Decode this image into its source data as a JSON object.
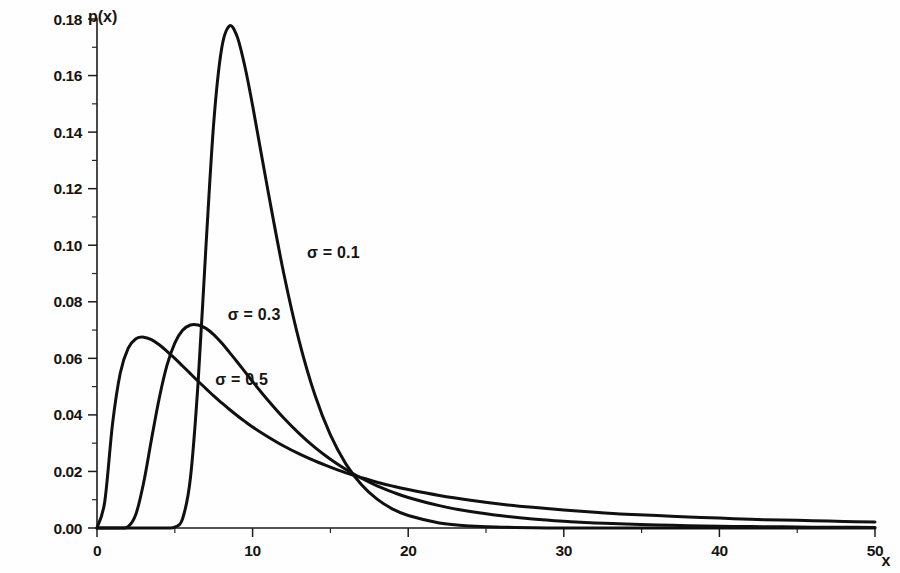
{
  "figure": {
    "name": "lognormal-pdf-family",
    "background_color": "#fefefe",
    "ink_color": "#101010"
  },
  "axes": {
    "y_title": "p(x)",
    "x_title": "x",
    "y_ticks": [
      "0.00",
      "0.02",
      "0.04",
      "0.06",
      "0.08",
      "0.10",
      "0.12",
      "0.14",
      "0.16",
      "0.18"
    ],
    "y_tick_values": [
      0.0,
      0.02,
      0.04,
      0.06,
      0.08,
      0.1,
      0.12,
      0.14,
      0.16,
      0.18
    ],
    "y_minor_tick_values": [
      0.01,
      0.03,
      0.05,
      0.07,
      0.09,
      0.11,
      0.13,
      0.15,
      0.17
    ],
    "x_ticks": [
      "0",
      "10",
      "20",
      "30",
      "40",
      "50"
    ],
    "x_tick_values": [
      0,
      10,
      20,
      30,
      40,
      50
    ],
    "x_minor_tick_values": [
      5,
      15,
      25,
      35,
      45
    ]
  },
  "curve_labels": [
    {
      "text": "σ = 0.1",
      "x_data": 13.5,
      "y_data": 0.0955
    },
    {
      "text": "σ = 0.3",
      "x_data": 8.4,
      "y_data": 0.0735
    },
    {
      "text": "σ = 0.5",
      "x_data": 7.6,
      "y_data": 0.0505
    }
  ],
  "chart_data": {
    "type": "line",
    "title": "",
    "subtitle": "",
    "xlabel": "x",
    "ylabel": "p(x)",
    "xlim": [
      0,
      50
    ],
    "ylim": [
      0.0,
      0.18
    ],
    "grid": false,
    "legend": "inline-annotations",
    "distribution": "lognormal",
    "x": [
      0,
      0.5,
      1,
      1.5,
      2,
      2.5,
      3,
      3.5,
      4,
      4.5,
      5,
      5.5,
      6,
      6.5,
      7,
      7.5,
      8,
      8.5,
      9,
      9.5,
      10,
      11,
      12,
      13,
      14,
      15,
      16,
      17,
      18,
      19,
      20,
      22,
      24,
      26,
      28,
      30,
      32,
      34,
      36,
      38,
      40,
      42,
      44,
      46,
      48,
      50
    ],
    "series": [
      {
        "name": "σ = 0.1",
        "label": "σ = 0.1",
        "sigma": 0.1,
        "median": 10.0,
        "peak_x": 9.4,
        "peak_y": 0.178,
        "values": [
          0.0,
          0.0,
          0.0,
          0.0,
          0.0,
          0.0,
          0.0,
          0.0,
          0.0,
          0.0,
          0.0003,
          0.0033,
          0.0175,
          0.0517,
          0.0993,
          0.1432,
          0.1692,
          0.1775,
          0.1739,
          0.1633,
          0.1494,
          0.1189,
          0.0901,
          0.066,
          0.0471,
          0.0329,
          0.0226,
          0.0153,
          0.0102,
          0.0067,
          0.0044,
          0.0018,
          0.0007,
          0.0003,
          0.0001,
          0.0,
          0.0,
          0.0,
          0.0,
          0.0,
          0.0,
          0.0,
          0.0,
          0.0,
          0.0,
          0.0
        ]
      },
      {
        "name": "σ = 0.3",
        "label": "σ = 0.3",
        "sigma": 0.3,
        "median": 10.0,
        "peak_x": 6.2,
        "peak_y": 0.0732,
        "values": [
          0.0,
          0.0,
          0.0,
          0.0,
          0.0005,
          0.0049,
          0.0161,
          0.0313,
          0.0459,
          0.0576,
          0.0654,
          0.0699,
          0.0718,
          0.0718,
          0.0706,
          0.0684,
          0.0655,
          0.0622,
          0.0588,
          0.0553,
          0.0518,
          0.0451,
          0.0389,
          0.0334,
          0.0285,
          0.0243,
          0.0207,
          0.0176,
          0.0149,
          0.0127,
          0.0108,
          0.0079,
          0.0058,
          0.0043,
          0.0032,
          0.0024,
          0.0018,
          0.0014,
          0.0011,
          0.0008,
          0.0006,
          0.0005,
          0.0004,
          0.0003,
          0.0003,
          0.0002
        ]
      },
      {
        "name": "σ = 0.5",
        "label": "σ = 0.5",
        "sigma": 0.5,
        "median": 10.0,
        "peak_x": 2.7,
        "peak_y": 0.0676,
        "values": [
          0.0,
          0.0094,
          0.0369,
          0.0549,
          0.0635,
          0.0669,
          0.0675,
          0.0666,
          0.0648,
          0.0625,
          0.06,
          0.0573,
          0.0546,
          0.0519,
          0.0493,
          0.0467,
          0.0443,
          0.042,
          0.0398,
          0.0377,
          0.0357,
          0.0322,
          0.029,
          0.0262,
          0.0237,
          0.0215,
          0.0195,
          0.0178,
          0.0162,
          0.0148,
          0.0136,
          0.0115,
          0.0098,
          0.0084,
          0.0073,
          0.0064,
          0.0056,
          0.0049,
          0.0044,
          0.0039,
          0.0035,
          0.0031,
          0.0028,
          0.0026,
          0.0023,
          0.0021
        ]
      }
    ]
  }
}
